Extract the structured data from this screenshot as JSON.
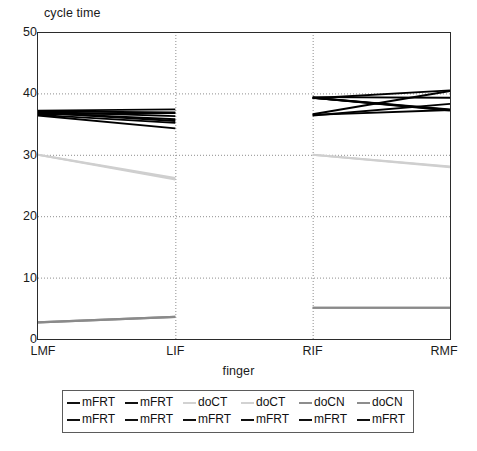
{
  "chart_data": {
    "type": "line",
    "title": "",
    "ylabel": "cycle time",
    "xlabel": "finger",
    "categories": [
      "LMF",
      "LIF",
      "RIF",
      "RMF"
    ],
    "ylim": [
      0,
      50
    ],
    "yticks": [
      0,
      10,
      20,
      30,
      40,
      50
    ],
    "grid": "horizontal-and-vertical-dotted",
    "legend_position": "below-plot",
    "note": "Lines are drawn only within the LMF-LIF segment and the RIF-RMF segment; no data is drawn across the LIF-RIF gap.",
    "series": [
      {
        "name": "mFRT",
        "color": "#000000",
        "values": [
          37.2,
          37.4,
          39.4,
          39.3
        ]
      },
      {
        "name": "mFRT",
        "color": "#000000",
        "values": [
          37.0,
          36.3,
          39.2,
          40.5
        ]
      },
      {
        "name": "doCT",
        "color": "#cfcfcf",
        "values": [
          30.0,
          26.0,
          30.0,
          28.0
        ]
      },
      {
        "name": "doCT",
        "color": "#cfcfcf",
        "values": [
          30.0,
          26.2,
          30.0,
          28.1
        ]
      },
      {
        "name": "doCN",
        "color": "#8a8a8a",
        "values": [
          2.7,
          3.6,
          5.1,
          5.1
        ]
      },
      {
        "name": "doCN",
        "color": "#8a8a8a",
        "values": [
          2.7,
          3.6,
          5.1,
          5.1
        ]
      },
      {
        "name": "mFRT",
        "color": "#000000",
        "values": [
          36.6,
          36.8,
          36.6,
          40.4
        ]
      },
      {
        "name": "mFRT",
        "color": "#000000",
        "values": [
          36.8,
          35.8,
          36.4,
          38.3
        ]
      },
      {
        "name": "mFRT",
        "color": "#000000",
        "values": [
          36.5,
          35.2,
          39.3,
          37.3
        ]
      },
      {
        "name": "mFRT",
        "color": "#000000",
        "values": [
          36.4,
          34.3,
          39.3,
          37.2
        ]
      },
      {
        "name": "mFRT",
        "color": "#000000",
        "values": [
          37.1,
          36.9,
          39.3,
          37.4
        ]
      },
      {
        "name": "mFRT",
        "color": "#000000",
        "values": [
          36.9,
          35.5,
          36.5,
          37.3
        ]
      }
    ]
  },
  "legend": {
    "rows": [
      [
        {
          "label": "mFRT",
          "color": "#111111"
        },
        {
          "label": "mFRT",
          "color": "#111111"
        },
        {
          "label": "doCT",
          "color": "#d2d2d2"
        },
        {
          "label": "doCT",
          "color": "#d2d2d2"
        },
        {
          "label": "doCN",
          "color": "#8d8d8d"
        },
        {
          "label": "doCN",
          "color": "#8d8d8d"
        }
      ],
      [
        {
          "label": "mFRT",
          "color": "#111111"
        },
        {
          "label": "mFRT",
          "color": "#111111"
        },
        {
          "label": "mFRT",
          "color": "#111111"
        },
        {
          "label": "mFRT",
          "color": "#111111"
        },
        {
          "label": "mFRT",
          "color": "#111111"
        },
        {
          "label": "mFRT",
          "color": "#111111"
        }
      ]
    ]
  }
}
